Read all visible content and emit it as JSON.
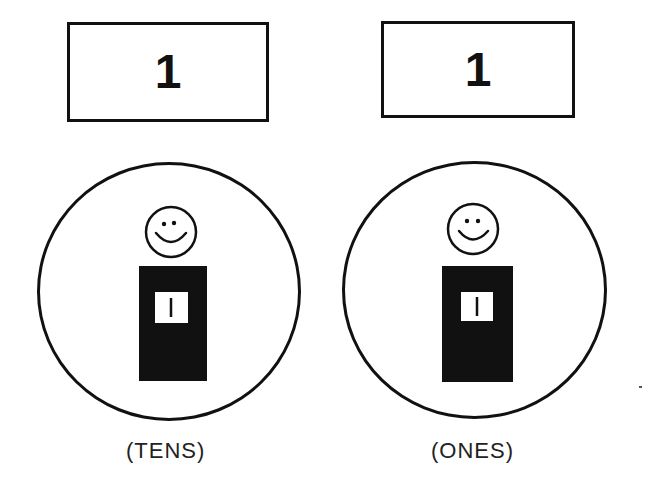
{
  "columns": [
    {
      "place": "tens",
      "digit": "1",
      "label": "(TENS)",
      "counter": {
        "figure": "smiley-person",
        "card_value": "1"
      }
    },
    {
      "place": "ones",
      "digit": "1",
      "label": "(ONES)",
      "counter": {
        "figure": "smiley-person",
        "card_value": "1"
      }
    }
  ],
  "colors": {
    "ink": "#111111",
    "paper": "#ffffff"
  }
}
